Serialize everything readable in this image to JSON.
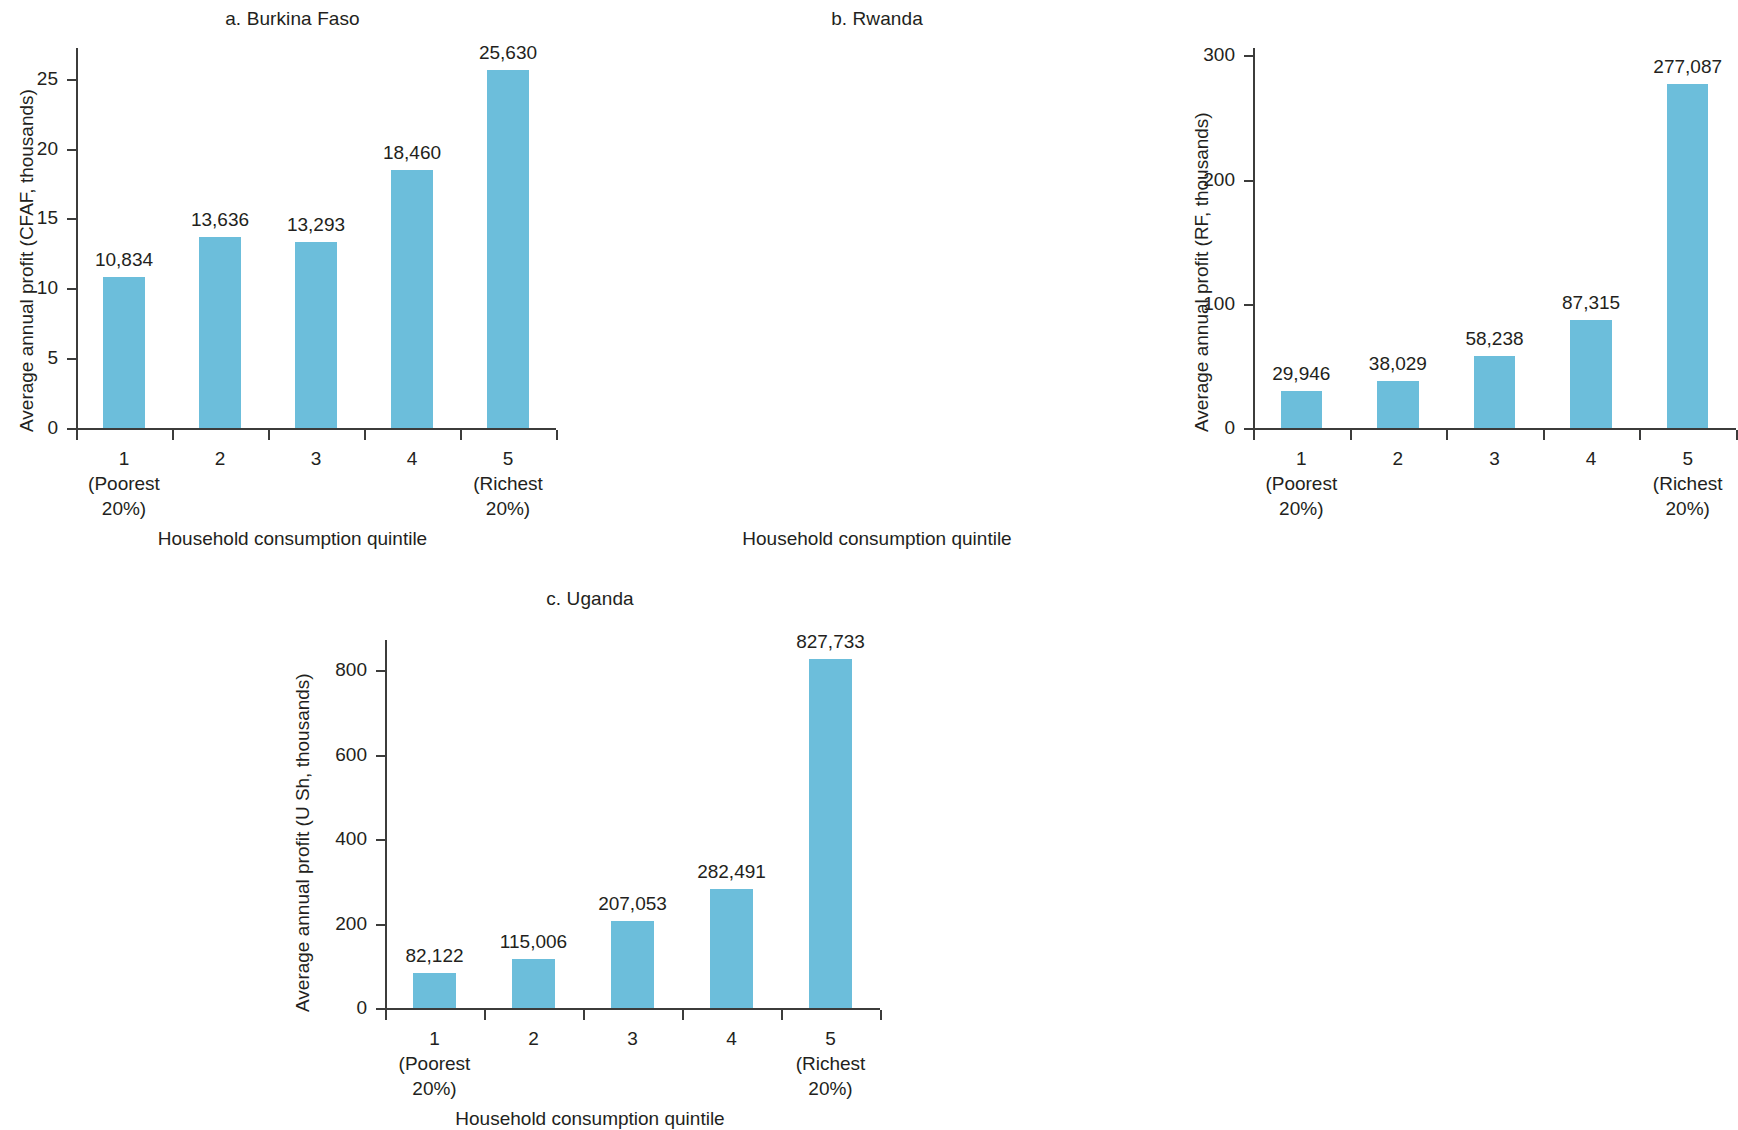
{
  "figure": {
    "shared": {
      "xlabel": "Household consumption quintile",
      "categories": [
        "1",
        "2",
        "3",
        "4",
        "5"
      ],
      "category_sublabels": [
        "(Poorest\n20%)",
        "",
        "",
        "",
        "(Richest\n20%)"
      ],
      "category_sub_line1": [
        "(Poorest",
        "",
        "",
        "",
        "(Richest"
      ],
      "category_sub_line2": [
        "20%)",
        "",
        "",
        "",
        "20%)"
      ],
      "bar_color": "#6cbedb",
      "axis_color": "#3c3c3b",
      "text_color": "#231f20"
    }
  },
  "chart_data": [
    {
      "type": "bar",
      "panel": "a",
      "title": "a. Burkina Faso",
      "xlabel": "Household consumption quintile",
      "ylabel": "Average annual profit (CFAF, thousands)",
      "categories": [
        "1",
        "2",
        "3",
        "4",
        "5"
      ],
      "category_full": [
        "1 (Poorest 20%)",
        "2",
        "3",
        "4",
        "5 (Richest 20%)"
      ],
      "values": [
        10.834,
        13.636,
        13.293,
        18.46,
        25.63
      ],
      "data_labels": [
        "10,834",
        "13,636",
        "13,293",
        "18,460",
        "25,630"
      ],
      "yticks": [
        0,
        5,
        10,
        15,
        20,
        25
      ],
      "ytick_labels": [
        "0",
        "5",
        "10",
        "15",
        "20",
        "25"
      ],
      "ylim": [
        0,
        27.2
      ],
      "grid": false,
      "legend": null,
      "units": "CFAF, thousands"
    },
    {
      "type": "bar",
      "panel": "b",
      "title": "b. Rwanda",
      "xlabel": "Household consumption quintile",
      "ylabel": "Average annual profit (RF, thousands)",
      "categories": [
        "1",
        "2",
        "3",
        "4",
        "5"
      ],
      "category_full": [
        "1 (Poorest 20%)",
        "2",
        "3",
        "4",
        "5 (Richest 20%)"
      ],
      "values": [
        29.946,
        38.029,
        58.238,
        87.315,
        277.087
      ],
      "data_labels": [
        "29,946",
        "38,029",
        "58,238",
        "87,315",
        "277,087"
      ],
      "yticks": [
        0,
        100,
        200,
        300
      ],
      "ytick_labels": [
        "0",
        "100",
        "200",
        "300"
      ],
      "ylim": [
        0,
        306
      ],
      "grid": false,
      "legend": null,
      "units": "RF, thousands"
    },
    {
      "type": "bar",
      "panel": "c",
      "title": "c. Uganda",
      "xlabel": "Household consumption quintile",
      "ylabel": "Average annual profit (U Sh, thousands)",
      "categories": [
        "1",
        "2",
        "3",
        "4",
        "5"
      ],
      "category_full": [
        "1 (Poorest 20%)",
        "2",
        "3",
        "4",
        "5 (Richest 20%)"
      ],
      "values": [
        82.122,
        115.006,
        207.053,
        282.491,
        827.733
      ],
      "data_labels": [
        "82,122",
        "115,006",
        "207,053",
        "282,491",
        "827,733"
      ],
      "yticks": [
        0,
        200,
        400,
        600,
        800
      ],
      "ytick_labels": [
        "0",
        "200",
        "400",
        "600",
        "800"
      ],
      "ylim": [
        0,
        872
      ],
      "grid": false,
      "legend": null,
      "units": "U Sh, thousands"
    }
  ]
}
